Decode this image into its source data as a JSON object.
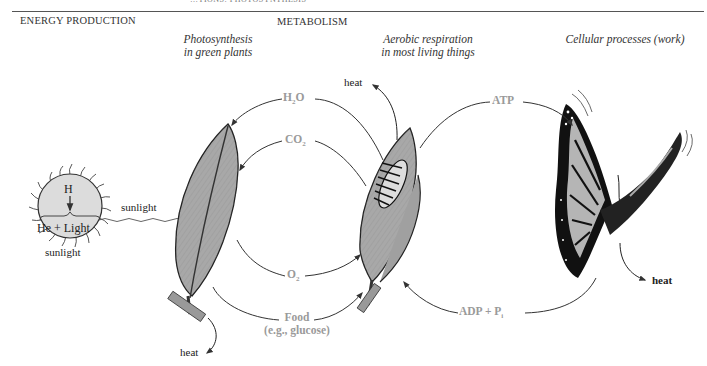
{
  "header": {
    "running_head": "…TIONS: PHOTOSYNTHESIS",
    "left_section": "ENERGY PRODUCTION",
    "center_section": "METABOLISM"
  },
  "columns": {
    "photosynthesis": {
      "line1": "Photosynthesis",
      "line2": "in green plants"
    },
    "respiration": {
      "line1": "Aerobic respiration",
      "line2": "in most living things"
    },
    "cellular": {
      "line1": "Cellular processes (work)"
    }
  },
  "sun": {
    "top_label": "H",
    "bottom_label": "He + Light",
    "caption": "sunlight",
    "arrow_label": "sunlight"
  },
  "cycle_left": {
    "h2o": {
      "base": "H",
      "sub": "2",
      "tail": "O"
    },
    "co2": {
      "base": "CO",
      "sub": "2"
    },
    "o2": {
      "base": "O",
      "sub": "2"
    },
    "food": {
      "line1": "Food",
      "line2": "(e.g., glucose)"
    }
  },
  "cycle_right": {
    "atp": "ATP",
    "adp": {
      "base": "ADP + P",
      "sub": "i"
    }
  },
  "heat_labels": {
    "respiration_heat": "heat",
    "plant_heat": "heat",
    "butterfly_heat": "heat"
  },
  "colors": {
    "leaf_fill": "#a8a8a8",
    "sun_fill": "#dcdcdc",
    "chem_label": "#9a9a9a",
    "arrow": "#333333",
    "butterfly_wing": "#b5b5b5"
  }
}
